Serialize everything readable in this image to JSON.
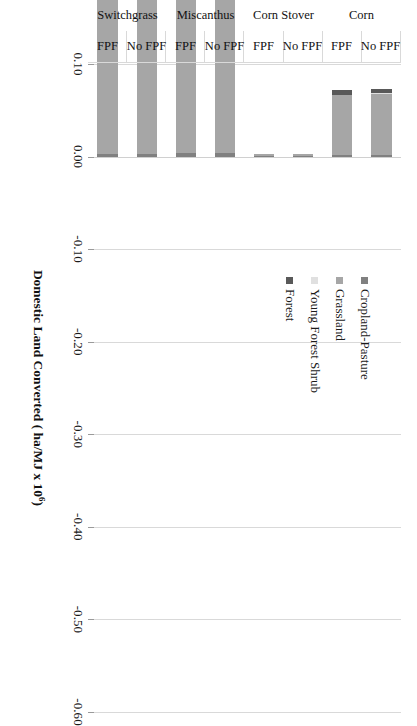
{
  "chart_data": {
    "type": "bar",
    "orientation": "horizontal-stacked",
    "title": "",
    "xlabel": "Domestic Land Converted ( ha/MJ x 10",
    "xlabel_sup": "6",
    "xlabel_tail": ")",
    "ylabel": "",
    "xlim": [
      0.1,
      -0.6
    ],
    "grid": true,
    "grid_axis": "x",
    "legend_position": "right-top",
    "tick_labels": [
      "0.10",
      "0.00",
      "-0.10",
      "-0.20",
      "-0.30",
      "-0.40",
      "-0.50",
      "-0.60"
    ],
    "tick_values": [
      0.1,
      0.0,
      -0.1,
      -0.2,
      -0.3,
      -0.4,
      -0.5,
      -0.6
    ],
    "categories": [
      "Switchgrass FPF",
      "Switchgrass No FPF",
      "Miscanthus FPF",
      "Miscanthus No FPF",
      "Corn Stover FPF",
      "Corn Stover No FPF",
      "Corn FPF",
      "Corn No FPF"
    ],
    "category_groups": [
      {
        "name": "Switchgrass",
        "subs": [
          "FPF",
          "No FPF"
        ]
      },
      {
        "name": "Miscanthus",
        "subs": [
          "FPF",
          "No FPF"
        ]
      },
      {
        "name": "Corn Stover",
        "subs": [
          "FPF",
          "No FPF"
        ]
      },
      {
        "name": "Corn",
        "subs": [
          "FPF",
          "No FPF"
        ]
      }
    ],
    "series": [
      {
        "name": "Cropland-Pasture",
        "color": "#808080",
        "values": [
          -0.003,
          -0.003,
          -0.004,
          -0.004,
          -0.001,
          -0.001,
          -0.002,
          -0.002
        ]
      },
      {
        "name": "Grassland",
        "color": "#a6a6a6",
        "values": [
          -0.497,
          -0.478,
          -0.31,
          -0.307,
          -0.002,
          -0.002,
          -0.064,
          -0.066
        ]
      },
      {
        "name": "Young Forest Shrub",
        "color": "#e0e0e0",
        "values": [
          -0.004,
          -0.003,
          -0.002,
          -0.002,
          0.0,
          0.0,
          -0.001,
          -0.001
        ]
      },
      {
        "name": "Forest",
        "color": "#595959",
        "values": [
          -0.029,
          -0.046,
          -0.006,
          -0.011,
          0.0,
          0.0,
          -0.005,
          -0.004
        ]
      }
    ],
    "totals": [
      -0.533,
      -0.53,
      -0.322,
      -0.324,
      -0.003,
      -0.003,
      -0.072,
      -0.073
    ]
  },
  "legend": {
    "items": [
      {
        "label": "Cropland-Pasture",
        "color": "#808080"
      },
      {
        "label": "Grassland",
        "color": "#a6a6a6"
      },
      {
        "label": "Young Forest Shrub",
        "color": "#e0e0e0"
      },
      {
        "label": "Forest",
        "color": "#595959"
      }
    ]
  },
  "axis": {
    "title_main": "Domestic Land Converted ( ha/MJ x 10",
    "title_sup": "6",
    "title_tail": ")"
  }
}
